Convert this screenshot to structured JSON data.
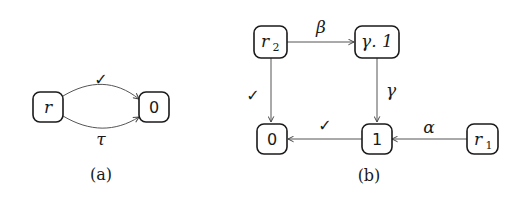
{
  "diagram_a": {
    "caption": "(a)",
    "nodes": {
      "r": {
        "label": "r"
      },
      "zero": {
        "label": "0"
      }
    },
    "edges": {
      "top": {
        "from": "r",
        "to": "0",
        "label": "✓"
      },
      "bottom": {
        "from": "r",
        "to": "0",
        "label": "τ"
      }
    }
  },
  "diagram_b": {
    "caption": "(b)",
    "nodes": {
      "r2": {
        "label": "r",
        "sub": "2"
      },
      "gamma1": {
        "label": "γ. 1"
      },
      "zero": {
        "label": "0"
      },
      "one": {
        "label": "1"
      },
      "r1": {
        "label": "r",
        "sub": "1"
      }
    },
    "edges": {
      "r2_gamma1": {
        "from": "r2",
        "to": "γ.1",
        "label": "β"
      },
      "r2_zero": {
        "from": "r2",
        "to": "0",
        "label": "✓"
      },
      "gamma1_one": {
        "from": "γ.1",
        "to": "1",
        "label": "γ"
      },
      "one_zero": {
        "from": "1",
        "to": "0",
        "label": "✓"
      },
      "r1_one": {
        "from": "r1",
        "to": "1",
        "label": "α"
      }
    }
  }
}
